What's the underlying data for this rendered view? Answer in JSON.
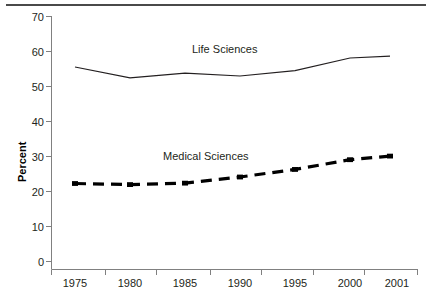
{
  "chart_data": {
    "type": "line",
    "title": "",
    "xlabel": "",
    "ylabel": "Percent",
    "x": [
      1975,
      1980,
      1985,
      1990,
      1995,
      2000,
      2001
    ],
    "categories": [
      "1975",
      "1980",
      "1985",
      "1990",
      "1995",
      "2000",
      "2001"
    ],
    "xtick_labels": [
      "1975",
      "1980",
      "1985",
      "1990",
      "1995",
      "2000",
      "2001"
    ],
    "ytick_labels": [
      "0",
      "10",
      "20",
      "30",
      "40",
      "50",
      "60",
      "70"
    ],
    "yticks": [
      0,
      10,
      20,
      30,
      40,
      50,
      60,
      70
    ],
    "ylim": [
      0,
      70
    ],
    "grid": false,
    "legend_position": "inline-annotations",
    "series": [
      {
        "name": "Life Sciences",
        "label": "Life Sciences",
        "style": "solid",
        "color": "#231f20",
        "values": [
          56.0,
          53.0,
          54.3,
          53.5,
          55.0,
          58.5,
          59.0
        ]
      },
      {
        "name": "Medical Sciences",
        "label": "Medical Sciences",
        "style": "dashed",
        "color": "#000000",
        "values": [
          23.7,
          23.4,
          23.8,
          25.5,
          27.6,
          30.3,
          31.3
        ]
      }
    ],
    "annotations": [
      {
        "text": "Life Sciences",
        "x": 240,
        "y": 50
      },
      {
        "text": "Medical Sciences",
        "x": 215,
        "y": 157
      }
    ]
  },
  "axis": {
    "y_title": "Percent"
  }
}
